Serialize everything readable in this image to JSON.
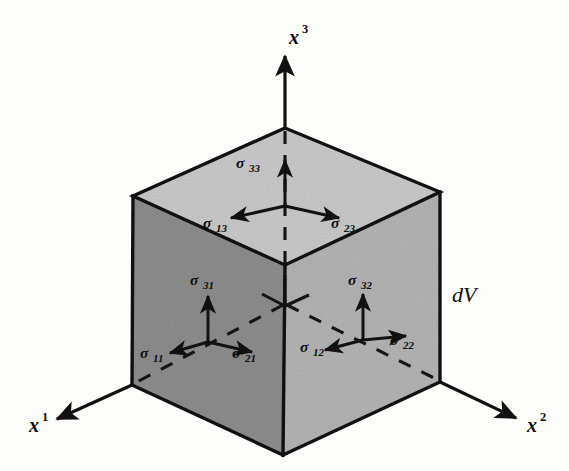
{
  "figure": {
    "background_color": "#fdfdfc",
    "line_color": "#111111",
    "volume_label": "dV"
  },
  "axes": [
    {
      "name": "x3",
      "label": "x",
      "exponent": "3",
      "direction": "up",
      "label_x": 289,
      "label_y": 44,
      "sup_x": 302,
      "sup_y": 33
    },
    {
      "name": "x1",
      "label": "x",
      "exponent": "1",
      "direction": "down-left",
      "label_x": 29,
      "label_y": 432,
      "sup_x": 42,
      "sup_y": 421
    },
    {
      "name": "x2",
      "label": "x",
      "exponent": "2",
      "direction": "down-right",
      "label_x": 527,
      "label_y": 432,
      "sup_x": 540,
      "sup_y": 421
    }
  ],
  "cube": {
    "vertices": {
      "top_back": [
        285,
        128
      ],
      "top_left": [
        133,
        196
      ],
      "top_right": [
        440,
        192
      ],
      "top_front": [
        285,
        265
      ],
      "bottom_left": [
        132,
        385
      ],
      "bottom_front": [
        283,
        455
      ],
      "bottom_right": [
        440,
        382
      ],
      "hidden_back": [
        285,
        305
      ]
    },
    "faces": [
      {
        "name": "top-face",
        "fill": "#c7c7c7"
      },
      {
        "name": "left-face",
        "fill": "#8c8c8c"
      },
      {
        "name": "right-face",
        "fill": "#b2b2b2"
      }
    ]
  },
  "stress_components": {
    "top_face": [
      {
        "name": "sigma-33",
        "symbol": "σ",
        "subscript": "33",
        "direction": "up",
        "label_x": 236,
        "label_y": 168,
        "sub_x": 249,
        "sub_y": 172
      },
      {
        "name": "sigma-13",
        "symbol": "σ",
        "subscript": "13",
        "direction": "down-left",
        "label_x": 203,
        "label_y": 228,
        "sub_x": 216,
        "sub_y": 232
      },
      {
        "name": "sigma-23",
        "symbol": "σ",
        "subscript": "23",
        "direction": "down-right",
        "label_x": 331,
        "label_y": 228,
        "sub_x": 344,
        "sub_y": 232
      }
    ],
    "left_face": [
      {
        "name": "sigma-31",
        "symbol": "σ",
        "subscript": "31",
        "direction": "up",
        "label_x": 190,
        "label_y": 285,
        "sub_x": 203,
        "sub_y": 289
      },
      {
        "name": "sigma-11",
        "symbol": "σ",
        "subscript": "11",
        "direction": "down-left",
        "label_x": 140,
        "label_y": 358,
        "sub_x": 153,
        "sub_y": 362
      },
      {
        "name": "sigma-21",
        "symbol": "σ",
        "subscript": "21",
        "direction": "down-right",
        "label_x": 232,
        "label_y": 358,
        "sub_x": 245,
        "sub_y": 362
      }
    ],
    "right_face": [
      {
        "name": "sigma-32",
        "symbol": "σ",
        "subscript": "32",
        "direction": "up",
        "label_x": 348,
        "label_y": 285,
        "sub_x": 361,
        "sub_y": 289
      },
      {
        "name": "sigma-12",
        "symbol": "σ",
        "subscript": "12",
        "direction": "down-left",
        "label_x": 300,
        "label_y": 352,
        "sub_x": 313,
        "sub_y": 356
      },
      {
        "name": "sigma-22",
        "symbol": "σ",
        "subscript": "22",
        "direction": "down-right",
        "label_x": 390,
        "label_y": 345,
        "sub_x": 403,
        "sub_y": 349
      }
    ]
  }
}
